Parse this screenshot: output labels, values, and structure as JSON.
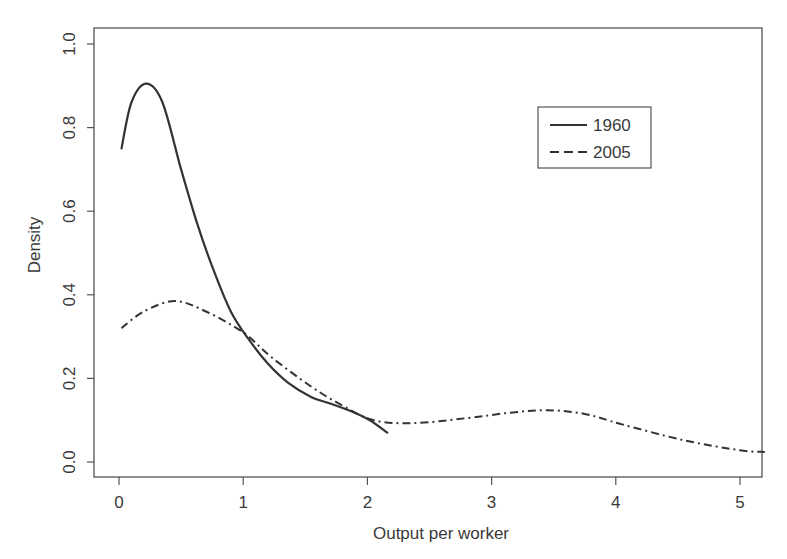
{
  "chart_data": {
    "type": "line",
    "title": "",
    "xlabel": "Output per worker",
    "ylabel": "Density",
    "xlim": [
      -0.2,
      5.2
    ],
    "ylim": [
      -0.035,
      1.04
    ],
    "x_ticks": [
      0,
      1,
      2,
      3,
      4,
      5
    ],
    "x_tick_labels": [
      "0",
      "1",
      "2",
      "3",
      "4",
      "5"
    ],
    "y_ticks": [
      0.0,
      0.2,
      0.4,
      0.6,
      0.8,
      1.0
    ],
    "y_tick_labels": [
      "0.0",
      "0.2",
      "0.4",
      "0.6",
      "0.8",
      "1.0"
    ],
    "grid": false,
    "legend_position": "upper right (inset)",
    "series": [
      {
        "name": "1960",
        "line_style": "solid",
        "legend_style": "solid",
        "color": "#333333",
        "x": [
          0.02,
          0.1,
          0.22,
          0.35,
          0.5,
          0.63,
          0.76,
          0.9,
          1.04,
          1.2,
          1.36,
          1.55,
          1.7,
          1.88,
          2.02,
          2.16
        ],
        "y": [
          0.75,
          0.86,
          0.905,
          0.86,
          0.7,
          0.57,
          0.46,
          0.36,
          0.295,
          0.235,
          0.19,
          0.155,
          0.14,
          0.12,
          0.1,
          0.07
        ]
      },
      {
        "name": "2005",
        "line_style": "dashdot",
        "legend_style": "dashed",
        "color": "#333333",
        "x": [
          0.02,
          0.2,
          0.45,
          0.7,
          1.0,
          1.23,
          1.55,
          1.8,
          2.05,
          2.37,
          2.8,
          3.15,
          3.45,
          3.75,
          4.05,
          4.55,
          5.0,
          5.2
        ],
        "y": [
          0.32,
          0.36,
          0.385,
          0.36,
          0.31,
          0.25,
          0.18,
          0.135,
          0.1,
          0.093,
          0.105,
          0.118,
          0.124,
          0.115,
          0.09,
          0.052,
          0.028,
          0.024
        ]
      }
    ]
  },
  "legend": {
    "items": [
      {
        "label": "1960"
      },
      {
        "label": "2005"
      }
    ]
  },
  "axes": {
    "xlabel": "Output per worker",
    "ylabel": "Density"
  }
}
